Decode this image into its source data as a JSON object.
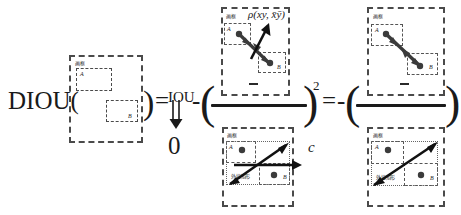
{
  "figure": {
    "type": "equation-diagram",
    "topic": "DIOU loss decomposition"
  },
  "equation": {
    "lhs_label": "DIOU(",
    "lhs_close": ")",
    "equals_1": "=",
    "iou_term": "IOU",
    "minus_1": "-",
    "open_paren_1": "(",
    "close_paren_1": ")",
    "exponent": "2",
    "equals_2": "=",
    "minus_2": "-",
    "open_paren_2": "(",
    "close_paren_2": ")",
    "limit_value": "0",
    "limit_arrow": "double-down-arrow"
  },
  "numerator": {
    "distance_expr": "ρ(xy, x̄ȳ)",
    "minus_sign": "-"
  },
  "denominator": {
    "diagonal_label": "c"
  },
  "panels": [
    {
      "id": "panel-left",
      "name": "non-overlapping-boxes",
      "frame_label": "画框",
      "box_a_label": "A",
      "box_b_label": "B",
      "has_dots": false,
      "has_arrows": false
    },
    {
      "id": "panel-mid-top",
      "name": "center-distance-rho",
      "frame_label": "画框",
      "box_a_label": "A",
      "box_b_label": "B",
      "expr": "ρ(xy, x̄ȳ)",
      "has_dots": true,
      "has_arrows": true
    },
    {
      "id": "panel-mid-bottom",
      "name": "enclosing-diagonal-c",
      "frame_label": "画框",
      "box_a_label": "A",
      "box_b_label": "B",
      "enclosing_label": "外接矩形",
      "diagonal_label": "c",
      "has_dots": true,
      "has_arrows": true
    },
    {
      "id": "panel-right-top",
      "name": "center-distance-rho-simplified",
      "frame_label": "画框",
      "box_a_label": "A",
      "box_b_label": "B",
      "has_dots": true,
      "has_arrows": true
    },
    {
      "id": "panel-right-bottom",
      "name": "enclosing-diagonal-simplified",
      "frame_label": "画框",
      "box_a_label": "A",
      "box_b_label": "B",
      "enclosing_label": "外接矩形",
      "has_dots": true,
      "has_arrows": true
    }
  ],
  "colors": {
    "ink": "#1a1a1a",
    "dash": "#4a4a4a",
    "dot": "#3b3b3b",
    "background": "#ffffff"
  }
}
